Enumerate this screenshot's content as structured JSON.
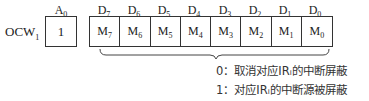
{
  "register": {
    "name": "OCW",
    "subscript": "1"
  },
  "a0": {
    "label": "A",
    "label_sub": "0",
    "value": "1"
  },
  "bits": [
    {
      "label": "D",
      "label_sub": "7",
      "cell": "M",
      "cell_sub": "7"
    },
    {
      "label": "D",
      "label_sub": "6",
      "cell": "M",
      "cell_sub": "6"
    },
    {
      "label": "D",
      "label_sub": "5",
      "cell": "M",
      "cell_sub": "5"
    },
    {
      "label": "D",
      "label_sub": "4",
      "cell": "M",
      "cell_sub": "4"
    },
    {
      "label": "D",
      "label_sub": "3",
      "cell": "M",
      "cell_sub": "3"
    },
    {
      "label": "D",
      "label_sub": "2",
      "cell": "M",
      "cell_sub": "2"
    },
    {
      "label": "D",
      "label_sub": "1",
      "cell": "M",
      "cell_sub": "1"
    },
    {
      "label": "D",
      "label_sub": "0",
      "cell": "M",
      "cell_sub": "0"
    }
  ],
  "notes": [
    "0：取消对应IRᵢ的中断屏蔽",
    "1：对应IRᵢ的中断源被屏蔽"
  ]
}
